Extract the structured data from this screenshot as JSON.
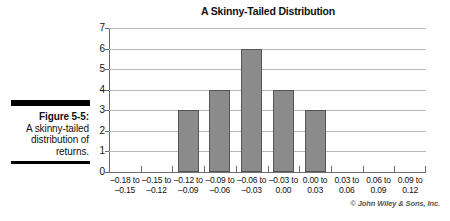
{
  "caption": {
    "figure_label": "Figure 5-5:",
    "description": "A skinny-tailed distribution of returns."
  },
  "credit": "© John Wiley & Sons, Inc.",
  "colors": {
    "bar_fill": "#8b8b8b",
    "bar_stroke": "#555555",
    "gridline": "#b9b9b9",
    "axis": "#6a6a6a",
    "text": "#111111"
  },
  "chart_data": {
    "type": "bar",
    "title": "A Skinny-Tailed Distribution",
    "xlabel": "",
    "ylabel": "",
    "categories": [
      "-0.18 to -0.15",
      "-0.15 to -0.12",
      "-0.12 to -0.09",
      "-0.09 to -0.06",
      "-0.06 to -0.03",
      "-0.03 to 0.00",
      "0.00 to 0.03",
      "0.03 to 0.06",
      "0.06 to 0.09",
      "0.09 to 0.12"
    ],
    "category_lines": [
      [
        "–0.18 to",
        "–0.15"
      ],
      [
        "–0.15 to",
        "–0.12"
      ],
      [
        "–0.12 to",
        "–0.09"
      ],
      [
        "–0.09 to",
        "–0.06"
      ],
      [
        "–0.06 to",
        "–0.03"
      ],
      [
        "–0.03 to",
        "0.00"
      ],
      [
        "0.00 to",
        "0.03"
      ],
      [
        "0.03 to",
        "0.06"
      ],
      [
        "0.06 to",
        "0.09"
      ],
      [
        "0.09 to",
        "0.12"
      ]
    ],
    "values": [
      0,
      0,
      3,
      4,
      6,
      4,
      3,
      0,
      0,
      0
    ],
    "ylim": [
      0,
      7
    ],
    "yticks": [
      0,
      1,
      2,
      3,
      4,
      5,
      6,
      7
    ],
    "ytick_labels": [
      "0",
      "1",
      "2",
      "3",
      "4",
      "5",
      "6",
      "7"
    ],
    "grid": true,
    "legend": false
  }
}
